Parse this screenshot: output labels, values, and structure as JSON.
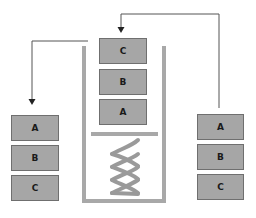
{
  "diagram": {
    "type": "stack-spring-dispenser",
    "colors": {
      "box_fill": "#a6a6a6",
      "box_border": "#6f6f6f",
      "container": "#a8a8a8",
      "spring": "#9a9a9a",
      "arrow": "#555555",
      "label": "#1a1a1a"
    },
    "center_stack": {
      "boxes": [
        {
          "label": "C"
        },
        {
          "label": "B"
        },
        {
          "label": "A"
        }
      ]
    },
    "left_stack": {
      "boxes": [
        {
          "label": "A"
        },
        {
          "label": "B"
        },
        {
          "label": "C"
        }
      ]
    },
    "right_stack": {
      "boxes": [
        {
          "label": "A"
        },
        {
          "label": "B"
        },
        {
          "label": "C"
        }
      ]
    },
    "arrows": [
      {
        "name": "push-arrow",
        "from": "right_stack",
        "to": "center_stack_top"
      },
      {
        "name": "pop-arrow",
        "from": "center_stack_top",
        "to": "left_stack"
      }
    ]
  }
}
